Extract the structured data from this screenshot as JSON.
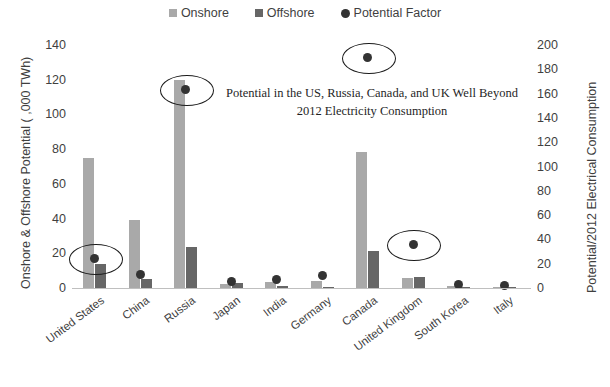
{
  "chart_data": {
    "type": "bar",
    "title": "",
    "subtitle": "",
    "xlabel": "",
    "ylabel": "Onshore & Offshore Potential ( ,000 TWh)",
    "y2label": "Potential/2012 Electrical Consumption",
    "ylim": [
      0,
      140
    ],
    "y2lim": [
      0,
      200
    ],
    "yticks": [
      0,
      20,
      40,
      60,
      80,
      100,
      120,
      140
    ],
    "y2ticks": [
      0,
      20,
      40,
      60,
      80,
      100,
      120,
      140,
      160,
      180,
      200
    ],
    "grid": false,
    "legend_position": "top-center",
    "categories": [
      "United States",
      "China",
      "Russia",
      "Japan",
      "India",
      "Germany",
      "Canada",
      "United Kingdom",
      "South Korea",
      "Italy"
    ],
    "series": [
      {
        "name": "Onshore",
        "axis": "left",
        "color": "#a9a9a9",
        "values": [
          75,
          39,
          120,
          2.5,
          3.5,
          4,
          78.5,
          5.5,
          1.2,
          0.4
        ]
      },
      {
        "name": "Offshore",
        "axis": "left",
        "color": "#666666",
        "values": [
          14,
          5,
          23.5,
          3,
          1,
          0.8,
          21.5,
          6.5,
          0.7,
          0.3
        ]
      },
      {
        "name": "Potential Factor",
        "axis": "right",
        "color": "#333333",
        "values": [
          24,
          11,
          163,
          5,
          7,
          10,
          190,
          36,
          3,
          2
        ]
      }
    ],
    "annotations": [
      {
        "name": "callout-text",
        "text_line1": "Potential in the US, Russia, Canada, and UK Well Beyond",
        "text_line2": "2012 Electricity Consumption"
      },
      {
        "name": "highlight-ellipse",
        "target": "United States"
      },
      {
        "name": "highlight-ellipse",
        "target": "Russia"
      },
      {
        "name": "highlight-ellipse",
        "target": "Canada"
      },
      {
        "name": "highlight-ellipse",
        "target": "United Kingdom"
      }
    ]
  },
  "legend": {
    "items": [
      {
        "label": "Onshore",
        "marker": "square",
        "color": "#a9a9a9"
      },
      {
        "label": "Offshore",
        "marker": "square",
        "color": "#666666"
      },
      {
        "label": "Potential Factor",
        "marker": "circle",
        "color": "#333333"
      }
    ]
  },
  "axes": {
    "left_title": "Onshore & Offshore Potential ( ,000 TWh)",
    "right_title": "Potential/2012 Electrical Consumption",
    "left_ticks": [
      "140",
      "120",
      "100",
      "80",
      "60",
      "40",
      "20",
      "0"
    ],
    "right_ticks": [
      "200",
      "180",
      "160",
      "140",
      "120",
      "100",
      "80",
      "60",
      "40",
      "20",
      "0"
    ]
  },
  "annotation": {
    "line1": "Potential in the US, Russia, Canada, and UK Well Beyond",
    "line2": "2012 Electricity Consumption"
  },
  "colors": {
    "onshore": "#a9a9a9",
    "offshore": "#666666",
    "dot": "#333333",
    "axis": "#bfbfbf",
    "text": "#3f3f3f",
    "ellipse": "#1a1a1a",
    "background": "#ffffff"
  }
}
